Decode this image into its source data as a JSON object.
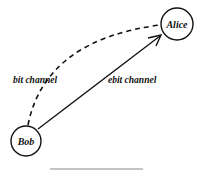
{
  "diagram": {
    "nodes": [
      {
        "id": "alice",
        "label": "Alice"
      },
      {
        "id": "bob",
        "label": "Bob"
      }
    ],
    "edges": [
      {
        "id": "bit",
        "from": "bob",
        "to": "alice",
        "label": "bit channel",
        "style": "dashed"
      },
      {
        "id": "ebit",
        "from": "bob",
        "to": "alice",
        "label": "ebit channel",
        "style": "solid-arrow"
      }
    ]
  },
  "colors": {
    "stroke": "#111111",
    "rule": "#888888"
  }
}
